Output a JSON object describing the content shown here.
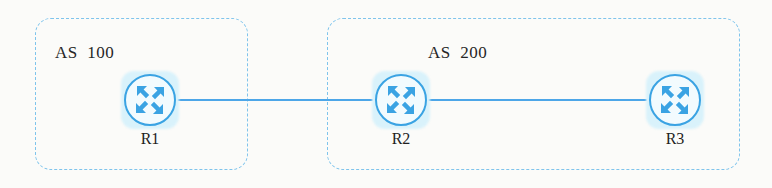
{
  "diagram": {
    "background_color": "#fbfbf9",
    "accent_color": "#3aa3e3",
    "link_color": "#4da6e8",
    "boundary_color": "#7fc4ec",
    "glow_color": "#d9f2fb"
  },
  "domains": [
    {
      "id": "as100",
      "label": "AS  100",
      "x": 35,
      "y": 18,
      "width": 213,
      "height": 152
    },
    {
      "id": "as200",
      "label": "AS  200",
      "x": 327,
      "y": 18,
      "width": 413,
      "height": 152
    }
  ],
  "nodes": [
    {
      "id": "r1",
      "label": "R1",
      "icon": "router-icon",
      "x": 121,
      "y": 71
    },
    {
      "id": "r2",
      "label": "R2",
      "icon": "router-icon",
      "x": 372,
      "y": 71
    },
    {
      "id": "r3",
      "label": "R3",
      "icon": "router-icon",
      "x": 646,
      "y": 71
    }
  ],
  "links": [
    {
      "id": "r1-r2",
      "from": "R1",
      "to": "R2",
      "x": 177,
      "y": 99,
      "length": 196
    },
    {
      "id": "r2-r3",
      "from": "R2",
      "to": "R3",
      "x": 428,
      "y": 99,
      "length": 219
    }
  ]
}
